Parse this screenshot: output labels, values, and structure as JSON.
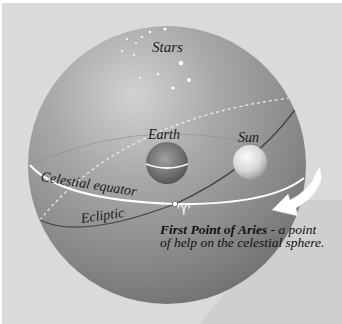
{
  "diagram": {
    "title": "Celestial sphere",
    "labels": {
      "stars": "Stars",
      "earth": "Earth",
      "sun": "Sun",
      "celestial_equator": "Celestial equator",
      "ecliptic": "Ecliptic"
    },
    "aries_symbol": "♈",
    "caption": {
      "bold": "First Point of Aries",
      "line1_rest": " - a point",
      "line2": "of help on the celestial sphere."
    },
    "colors": {
      "background": "#dadada",
      "sphere_light": "#c4c4c4",
      "sphere_dark": "#6f6f6f",
      "equator_line": "#ffffff",
      "ecliptic_line": "#4a4a4a",
      "text": "#1a1a1a"
    }
  }
}
